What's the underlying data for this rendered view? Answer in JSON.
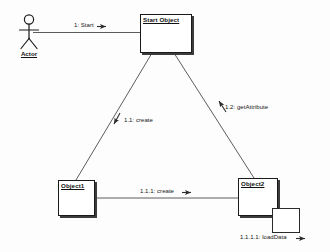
{
  "diagram": {
    "type": "uml-collaboration-diagram",
    "background_color": "#fdfdfd",
    "line_color": "#3b3b3b",
    "text_color": "#161616",
    "actor": {
      "name": "Actor",
      "icon": "stick-figure-actor-icon"
    },
    "objects": [
      {
        "id": "start-object",
        "label": "Start Object"
      },
      {
        "id": "object1",
        "label": "Object1"
      },
      {
        "id": "object2",
        "label": "Object2"
      }
    ],
    "messages": [
      {
        "id": "msg-1",
        "label": "1: Start",
        "sequence": "1",
        "operation": "Start",
        "from": "Actor",
        "to": "Start Object",
        "arrow": "right"
      },
      {
        "id": "msg-1-1",
        "label": "1.1: create",
        "sequence": "1.1",
        "operation": "create",
        "from": "Start Object",
        "to": "Object1",
        "arrow": "down-left"
      },
      {
        "id": "msg-1-2",
        "label": "1.2: getAttribute",
        "sequence": "1.2",
        "operation": "getAttribute",
        "from": "Object2",
        "to": "Start Object",
        "arrow": "up-left"
      },
      {
        "id": "msg-1-1-1",
        "label": "1.1.1: create",
        "sequence": "1.1.1",
        "operation": "create",
        "from": "Object1",
        "to": "Object2",
        "arrow": "right"
      },
      {
        "id": "msg-1-1-1-1",
        "label": "1.1.1.1: loadData",
        "sequence": "1.1.1.1",
        "operation": "loadData",
        "from": "Object2",
        "to": "Object2",
        "arrow": "right"
      }
    ]
  }
}
